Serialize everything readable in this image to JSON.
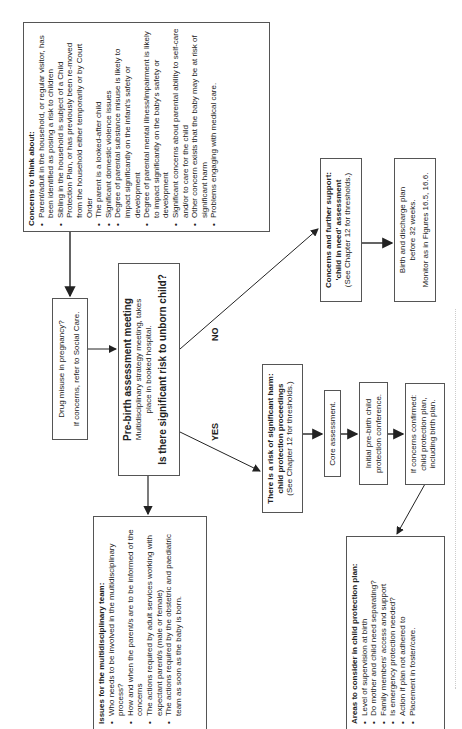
{
  "concerns": {
    "title": "Concerns to think about:",
    "items": [
      "Parent/adult in the household, or regular visitor, has been identified as posing a risk to children",
      "Sibling in the household is subject of a Child Protection Plan, or has previously been re-moved from the household either temporarily or by Court Order",
      "The parent is a looked-after child",
      "Significant domestic violence issues",
      "Degree of parental substance misuse is likely to impact significantly on the infant's safety or development",
      "Degree of parental mental illness/impairment is likely to impact significantly on the baby's safety or development",
      "Significant concerns about parental ability to self-care and/or to care for the child",
      "Other concern exists that the baby may be at risk of significant harm",
      "Problems engaging with medical care."
    ]
  },
  "drug": {
    "line1": "Drug misuse in pregnancy?",
    "line2": "If concerns, refer to Social Care."
  },
  "prebirth": {
    "title": "Pre-birth assessment meeting",
    "subtitle": "Multidisciplinary strategy meeting, takes place in booked hospital.",
    "question": "Is there significant risk to unborn child?"
  },
  "labels": {
    "yes": "YES",
    "no": "NO"
  },
  "issues": {
    "title": "Issues for the multidisciplinary team:",
    "items": [
      "Who needs to be involved in the multidisciplinary process?",
      "How and when the parent/s are to be informed of the concerns",
      "The actions required by adult services working with expectant parent/s (male or female)",
      "The actions required by the obstetric and paediatric team as soon as the baby is born."
    ]
  },
  "child_in_need": {
    "title1": "Concerns and further support:",
    "title2": "'child in need' assessment",
    "note": "(See Chapter 12 for thresholds.)"
  },
  "birth_plan": {
    "line1": "Birth and discharge plan before 32 weeks.",
    "line2": "Monitor as in Figures 16.5, 16.6."
  },
  "harm": {
    "title": "There is a risk of significant harm: child protection proceedings",
    "note": "(See Chapter 12 for thresholds.)"
  },
  "core": {
    "text": "Core assessment."
  },
  "conference": {
    "text": "Initial pre-birth child protection conference."
  },
  "confirmed": {
    "text": "If concerns confirmed: child protection plan, including birth plan."
  },
  "areas": {
    "title": "Areas to consider in child protection plan:",
    "items": [
      "Level of supervision at birth",
      "Do mother and child need separating?",
      "Family members' access and support",
      "Is emergency protection needed?",
      "Action if plan not adhered to",
      "Placement in foster/care."
    ]
  }
}
